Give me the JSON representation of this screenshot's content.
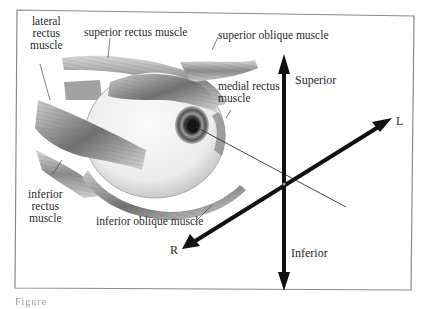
{
  "figure": {
    "labels": {
      "lateral_rectus": [
        "lateral",
        "rectus",
        "muscle"
      ],
      "superior_rectus": "superior rectus muscle",
      "superior_oblique": "superior oblique muscle",
      "medial_rectus": [
        "medial rectus",
        "muscle"
      ],
      "inferior_rectus": [
        "inferior",
        "rectus",
        "muscle"
      ],
      "inferior_oblique": "inferior oblique muscle"
    },
    "axes": {
      "superior": "Superior",
      "inferior": "Inferior",
      "left": "L",
      "right": "R"
    },
    "caption": "Figure"
  },
  "colors": {
    "frame": "#8a8a8a",
    "axis": "#111111",
    "muscle_dark": "#555555",
    "muscle_light": "#cfcfcf",
    "eyeball": "#f1f1f1"
  }
}
